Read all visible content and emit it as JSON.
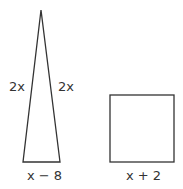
{
  "figure": {
    "triangle": {
      "left_side_label": "2x",
      "right_side_label": "2x",
      "base_label": "x − 8"
    },
    "square": {
      "base_label": "x + 2"
    },
    "colors": {
      "stroke": "#333333",
      "text": "#333333",
      "background": "#ffffff"
    }
  }
}
